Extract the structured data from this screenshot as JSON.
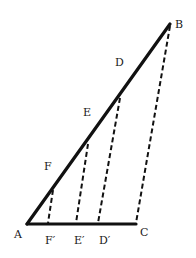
{
  "diagram": {
    "type": "geometric-construction",
    "colors": {
      "line": "#111111",
      "label": "#1a1a1a",
      "background": "#ffffff"
    },
    "points": {
      "A": {
        "x": 27,
        "y": 224
      },
      "B": {
        "x": 170,
        "y": 24
      },
      "C": {
        "x": 136,
        "y": 224
      },
      "D": {
        "x": 120,
        "y": 96
      },
      "E": {
        "x": 88,
        "y": 142
      },
      "F": {
        "x": 53,
        "y": 188
      },
      "D_prime": {
        "x": 98,
        "y": 224
      },
      "E_prime": {
        "x": 76,
        "y": 224
      },
      "F_prime": {
        "x": 48,
        "y": 224
      }
    },
    "solid_segments": [
      {
        "from": "A",
        "to": "B"
      },
      {
        "from": "A",
        "to": "C"
      }
    ],
    "dashed_segments": [
      {
        "from": "B",
        "to": "C"
      },
      {
        "from": "D",
        "to": "D'"
      },
      {
        "from": "E",
        "to": "E'"
      },
      {
        "from": "F",
        "to": "F'"
      }
    ],
    "labels": {
      "A": "A",
      "B": "B",
      "C": "C",
      "D": "D",
      "E": "E",
      "F": "F",
      "D_prime": "D′",
      "E_prime": "E′",
      "F_prime": "F′"
    }
  }
}
